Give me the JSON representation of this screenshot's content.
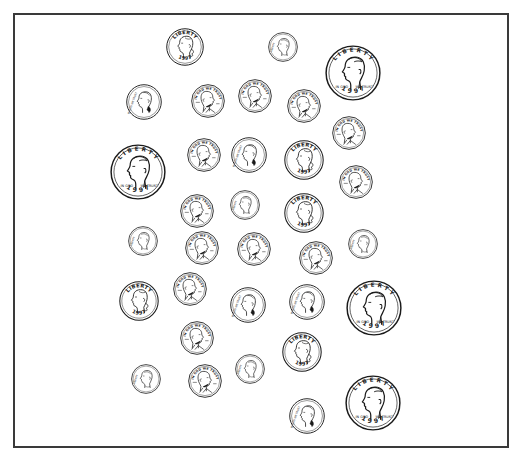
{
  "worksheet": {
    "frame_color": "#3a3a3a",
    "ink_color": "#1a1a1a",
    "coin_types": {
      "quarter": {
        "label": "quarter",
        "top_text": "LIBERTY",
        "year": "1997",
        "portrait": "washington-left"
      },
      "dime": {
        "label": "dime",
        "top_text": "",
        "year": "",
        "portrait": "roosevelt-left"
      },
      "penny": {
        "label": "penny",
        "top_text": "IN GOD WE TRUST",
        "year": "",
        "portrait": "lincoln-right"
      },
      "nickel": {
        "label": "nickel",
        "top_text": "IN GOD WE TRUST",
        "year": "",
        "portrait": "jefferson-left"
      },
      "half_dollar": {
        "label": "half dollar",
        "top_text": "LIBERTY",
        "year": "1997",
        "bottom_left": "IN GOD",
        "bottom_right": "WE TRUST",
        "portrait": "kennedy-left"
      }
    },
    "coins": [
      {
        "type": "quarter",
        "x": 185,
        "y": 47,
        "r": 19
      },
      {
        "type": "dime",
        "x": 283,
        "y": 47,
        "r": 15
      },
      {
        "type": "half_dollar",
        "x": 353,
        "y": 73,
        "r": 28
      },
      {
        "type": "nickel",
        "x": 144,
        "y": 102,
        "r": 18
      },
      {
        "type": "penny",
        "x": 208,
        "y": 101,
        "r": 17
      },
      {
        "type": "penny",
        "x": 255,
        "y": 96,
        "r": 17
      },
      {
        "type": "penny",
        "x": 304,
        "y": 106,
        "r": 17
      },
      {
        "type": "penny",
        "x": 349,
        "y": 133,
        "r": 17
      },
      {
        "type": "half_dollar",
        "x": 138,
        "y": 172,
        "r": 28
      },
      {
        "type": "penny",
        "x": 204,
        "y": 155,
        "r": 17
      },
      {
        "type": "nickel",
        "x": 249,
        "y": 155,
        "r": 18
      },
      {
        "type": "quarter",
        "x": 304,
        "y": 160,
        "r": 20
      },
      {
        "type": "penny",
        "x": 356,
        "y": 182,
        "r": 17
      },
      {
        "type": "penny",
        "x": 197,
        "y": 211,
        "r": 17
      },
      {
        "type": "dime",
        "x": 245,
        "y": 205,
        "r": 15
      },
      {
        "type": "quarter",
        "x": 304,
        "y": 213,
        "r": 20
      },
      {
        "type": "dime",
        "x": 143,
        "y": 241,
        "r": 15
      },
      {
        "type": "penny",
        "x": 202,
        "y": 248,
        "r": 17
      },
      {
        "type": "penny",
        "x": 254,
        "y": 249,
        "r": 17
      },
      {
        "type": "penny",
        "x": 316,
        "y": 258,
        "r": 17
      },
      {
        "type": "dime",
        "x": 363,
        "y": 244,
        "r": 15
      },
      {
        "type": "penny",
        "x": 190,
        "y": 289,
        "r": 17
      },
      {
        "type": "quarter",
        "x": 139,
        "y": 301,
        "r": 20
      },
      {
        "type": "nickel",
        "x": 248,
        "y": 305,
        "r": 18
      },
      {
        "type": "nickel",
        "x": 307,
        "y": 302,
        "r": 18
      },
      {
        "type": "half_dollar",
        "x": 374,
        "y": 308,
        "r": 28
      },
      {
        "type": "penny",
        "x": 197,
        "y": 338,
        "r": 17
      },
      {
        "type": "quarter",
        "x": 302,
        "y": 352,
        "r": 20
      },
      {
        "type": "dime",
        "x": 146,
        "y": 379,
        "r": 15
      },
      {
        "type": "penny",
        "x": 205,
        "y": 381,
        "r": 17
      },
      {
        "type": "dime",
        "x": 250,
        "y": 369,
        "r": 15
      },
      {
        "type": "nickel",
        "x": 307,
        "y": 416,
        "r": 18
      },
      {
        "type": "half_dollar",
        "x": 373,
        "y": 403,
        "r": 28
      }
    ]
  }
}
